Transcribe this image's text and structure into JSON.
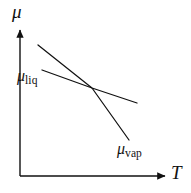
{
  "figure": {
    "axes": {
      "y_axis_label": "μ",
      "x_axis_label": "T"
    },
    "curves": [
      {
        "id": "mu-liq",
        "label_symbol": "μ",
        "label_subscript": "liq",
        "label_text": "μliq"
      },
      {
        "id": "mu-vap",
        "label_symbol": "μ",
        "label_subscript": "vap",
        "label_text": "μvap"
      }
    ],
    "colors": {
      "ink": "#111111",
      "background": "#ffffff"
    }
  },
  "chart_data": {
    "type": "line",
    "title": "",
    "xlabel": "T",
    "ylabel": "μ",
    "grid": false,
    "legend": "inline-annotations",
    "xlim": [
      0,
      191
    ],
    "ylim": [
      0,
      193
    ],
    "axis_origin_px": [
      20,
      176
    ],
    "x_axis_end_px": [
      168,
      176
    ],
    "y_axis_end_px": [
      20,
      27
    ],
    "intersection_px": [
      92,
      88
    ],
    "series": [
      {
        "name": "μliq",
        "description": "chemical potential of the liquid phase, shallow negative slope",
        "points_px": [
          [
            42,
            70
          ],
          [
            92,
            88
          ],
          [
            137,
            103
          ]
        ],
        "slope_sign": "negative",
        "slope_magnitude": "shallow"
      },
      {
        "name": "μvap",
        "description": "chemical potential of the vapour phase, steeper negative slope",
        "points_px": [
          [
            38,
            45
          ],
          [
            92,
            88
          ],
          [
            129,
            140
          ]
        ],
        "slope_sign": "negative",
        "slope_magnitude": "steep"
      }
    ],
    "annotations": [
      {
        "text": "μliq",
        "position_px": [
          17,
          68
        ]
      },
      {
        "text": "μvap",
        "position_px": [
          117,
          141
        ]
      },
      {
        "text": "μ",
        "position_px": [
          12,
          2
        ]
      },
      {
        "text": "T",
        "position_px": [
          171,
          163
        ]
      }
    ]
  }
}
